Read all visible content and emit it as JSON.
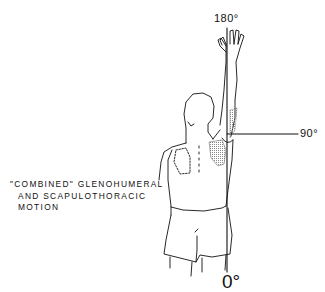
{
  "figure": {
    "angles": {
      "top": "180°",
      "horizontal": "90°",
      "bottom": "0°"
    },
    "caption": {
      "line1": "\"COMBINED\" GLENOHUMERAL",
      "line2": "AND SCAPULOTHORACIC",
      "line3": "MOTION"
    },
    "colors": {
      "ink": "#111111",
      "background": "#ffffff",
      "shading": "#9a9a9a"
    }
  }
}
